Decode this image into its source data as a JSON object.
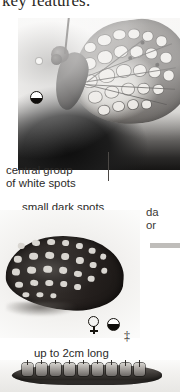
{
  "page": {
    "headline": "key features:",
    "background_color": "#ffffff"
  },
  "labels": {
    "central_spots_line1": "central group",
    "central_spots_line2": "of white spots",
    "small_dark_spots": "small dark spots",
    "size_note": "up to 2cm long",
    "right_col_line1": "da",
    "right_col_line2": "or"
  },
  "symbols": {
    "half_circle_upper": "half-filled-circle",
    "female": "♀",
    "half_circle_lower": "half-filled-circle",
    "plus_minus": "‡"
  },
  "plates": {
    "upper": {
      "caption_ref": "central group of white spots",
      "subject": "fritillary butterfly perched, wings open, greyscale photo"
    },
    "lower": {
      "caption_ref": "small dark spots",
      "subject": "dark fritillary butterfly underside, greyscale photo"
    },
    "caterpillar": {
      "caption_ref": "up to 2cm long",
      "subject": "spiny caterpillar, greyscale photo"
    }
  },
  "colors": {
    "text": "#2c2a28",
    "leader_line": "#4b4845",
    "rule": "#bfbdba",
    "ink": "#15130f"
  }
}
